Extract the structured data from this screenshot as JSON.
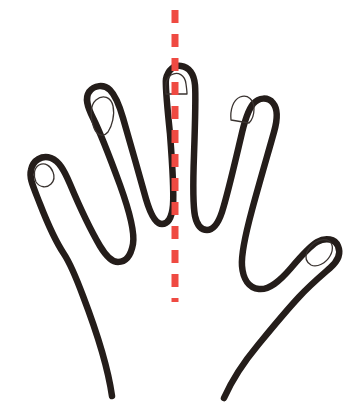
{
  "figure": {
    "title": "Hand outline with vertical line of symmetry",
    "background_color": "#ffffff",
    "width": 356,
    "height": 420
  },
  "drawing": {
    "outline": {
      "name": "hand-outline",
      "stroke_color": "#241d1a",
      "stroke_width": 6.5,
      "fill": "none",
      "style": "continuous freehand contour, open at wrist"
    },
    "nails": {
      "name": "fingernail-outlines",
      "stroke_color": "#3a3330",
      "stroke_width": 1.3,
      "fill": "none",
      "count": 5,
      "labels": [
        "pinky-nail",
        "ring-nail",
        "middle-nail",
        "index-nail",
        "thumb-nail"
      ]
    },
    "symmetry_axis": {
      "name": "symmetry-axis",
      "stroke_color": "#ef4a42",
      "stroke_width": 7,
      "dash_on": 13,
      "dash_off": 11,
      "orientation": "vertical",
      "x": 175,
      "y_start": 10,
      "y_end": 302,
      "description": "red dashed vertical line of symmetry through the middle finger"
    }
  },
  "fingers": [
    {
      "name": "pinky",
      "label": "Pinky",
      "tip_x": 44,
      "tip_y": 172,
      "side": "left"
    },
    {
      "name": "ring",
      "label": "Ring",
      "tip_x": 100,
      "tip_y": 108,
      "side": "left"
    },
    {
      "name": "middle",
      "label": "Middle",
      "tip_x": 175,
      "tip_y": 72,
      "side": "center"
    },
    {
      "name": "index",
      "label": "Index",
      "tip_x": 240,
      "tip_y": 100,
      "side": "right"
    },
    {
      "name": "thumb",
      "label": "Thumb",
      "tip_x": 322,
      "tip_y": 248,
      "side": "right"
    }
  ],
  "colors": {
    "ink": "#241d1a",
    "nail_ink": "#3a3330",
    "axis_red": "#ef4a42",
    "paper": "#ffffff"
  }
}
